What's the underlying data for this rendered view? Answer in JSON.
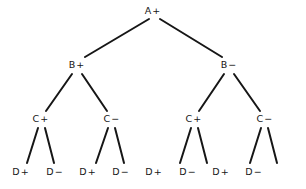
{
  "diagram": {
    "background_color": "#ffffff",
    "line_color": "#161616",
    "text_color": "#161616",
    "line_width": 2,
    "levels": [
      {
        "name": "root",
        "nodes": [
          {
            "id": "A",
            "label": "A+",
            "x": 153,
            "y": 11
          }
        ]
      },
      {
        "name": "level-1",
        "nodes": [
          {
            "id": "B1",
            "label": "B+",
            "x": 77,
            "y": 65
          },
          {
            "id": "B2",
            "label": "B−",
            "x": 229,
            "y": 65
          }
        ]
      },
      {
        "name": "level-2",
        "nodes": [
          {
            "id": "C1",
            "label": "C+",
            "x": 41,
            "y": 119
          },
          {
            "id": "C2",
            "label": "C−",
            "x": 112,
            "y": 119
          },
          {
            "id": "C3",
            "label": "C+",
            "x": 194,
            "y": 119
          },
          {
            "id": "C4",
            "label": "C−",
            "x": 265,
            "y": 119
          }
        ]
      },
      {
        "name": "leaves",
        "nodes": [
          {
            "id": "D1",
            "label": "D+",
            "x": 21,
            "y": 172
          },
          {
            "id": "D2",
            "label": "D−",
            "x": 55,
            "y": 172
          },
          {
            "id": "D3",
            "label": "D+",
            "x": 88,
            "y": 172
          },
          {
            "id": "D4",
            "label": "D−",
            "x": 121,
            "y": 172
          },
          {
            "id": "D5",
            "label": "D+",
            "x": 154,
            "y": 172
          },
          {
            "id": "D6",
            "label": "D−",
            "x": 188,
            "y": 172
          },
          {
            "id": "D7",
            "label": "D+",
            "x": 221,
            "y": 172
          },
          {
            "id": "D8",
            "label": "D−",
            "x": 254,
            "y": 172
          }
        ]
      }
    ],
    "edges": [
      {
        "from": "A",
        "to": "B1",
        "x1": 149,
        "y1": 19,
        "x2": 85,
        "y2": 57
      },
      {
        "from": "A",
        "to": "B2",
        "x1": 160,
        "y1": 19,
        "x2": 222,
        "y2": 57
      },
      {
        "from": "B1",
        "to": "C1",
        "x1": 72,
        "y1": 74,
        "x2": 46,
        "y2": 111
      },
      {
        "from": "B1",
        "to": "C2",
        "x1": 82,
        "y1": 74,
        "x2": 107,
        "y2": 111
      },
      {
        "from": "B2",
        "to": "C3",
        "x1": 224,
        "y1": 74,
        "x2": 199,
        "y2": 111
      },
      {
        "from": "B2",
        "to": "C4",
        "x1": 234,
        "y1": 74,
        "x2": 260,
        "y2": 111
      },
      {
        "from": "C1",
        "to": "D1",
        "x1": 38,
        "y1": 128,
        "x2": 27,
        "y2": 163
      },
      {
        "from": "C1",
        "to": "D2",
        "x1": 45,
        "y1": 128,
        "x2": 54,
        "y2": 163
      },
      {
        "from": "C2",
        "to": "D3",
        "x1": 108,
        "y1": 128,
        "x2": 96,
        "y2": 163
      },
      {
        "from": "C2",
        "to": "D4",
        "x1": 115,
        "y1": 128,
        "x2": 124,
        "y2": 163
      },
      {
        "from": "C3",
        "to": "D5",
        "x1": 191,
        "y1": 128,
        "x2": 180,
        "y2": 163
      },
      {
        "from": "C3",
        "to": "D6",
        "x1": 198,
        "y1": 128,
        "x2": 207,
        "y2": 163
      },
      {
        "from": "C4",
        "to": "D7",
        "x1": 261,
        "y1": 128,
        "x2": 250,
        "y2": 163
      },
      {
        "from": "C4",
        "to": "D8",
        "x1": 268,
        "y1": 128,
        "x2": 277,
        "y2": 163
      }
    ]
  }
}
